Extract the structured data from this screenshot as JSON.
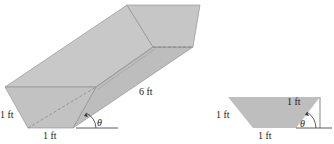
{
  "figure": {
    "left_view": {
      "labels": {
        "side": "1 ft",
        "bottom": "1 ft",
        "length": "6 ft",
        "angle": "θ"
      }
    },
    "right_view": {
      "labels": {
        "side_left": "1 ft",
        "side_right": "1 ft",
        "bottom": "1 ft",
        "angle": "θ"
      }
    },
    "colors": {
      "fill": "#c4c4c4",
      "fill_dark": "#b8b8b8",
      "edge": "#8a8a8a",
      "line": "#333333"
    }
  }
}
